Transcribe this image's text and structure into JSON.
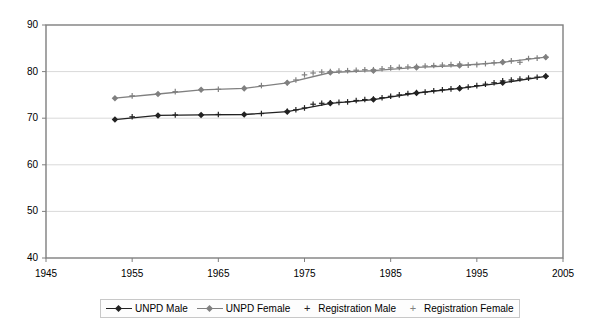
{
  "chart_data": {
    "type": "line",
    "title": "",
    "xlabel": "",
    "ylabel": "",
    "xlim": [
      1945,
      2005
    ],
    "ylim": [
      40,
      90
    ],
    "xticks": [
      1945,
      1955,
      1965,
      1975,
      1985,
      1995,
      2005
    ],
    "yticks": [
      40,
      50,
      60,
      70,
      80,
      90
    ],
    "grid": "horizontal",
    "legend_position": "bottom",
    "colors": {
      "unpd_male": "#222222",
      "unpd_female": "#808080",
      "registration_male": "#222222",
      "registration_female": "#808080",
      "gridline": "#d9d9d9",
      "axis": "#7f7f7f",
      "background": "#ffffff"
    },
    "series": [
      {
        "name": "UNPD Male",
        "marker": "diamond",
        "style": "line",
        "x": [
          1953,
          1958,
          1963,
          1968,
          1973,
          1978,
          1983,
          1988,
          1993,
          1998,
          2003
        ],
        "values": [
          69.7,
          70.6,
          70.7,
          70.8,
          71.4,
          73.2,
          74.0,
          75.4,
          76.4,
          77.6,
          79.0
        ]
      },
      {
        "name": "UNPD Female",
        "marker": "diamond",
        "style": "line",
        "x": [
          1953,
          1958,
          1963,
          1968,
          1973,
          1978,
          1983,
          1988,
          1993,
          1998,
          2003
        ],
        "values": [
          74.3,
          75.2,
          76.1,
          76.4,
          77.6,
          79.8,
          80.2,
          80.9,
          81.3,
          82.0,
          83.1
        ]
      },
      {
        "name": "Registration Male",
        "marker": "plus",
        "style": "markers",
        "x": [
          1955,
          1960,
          1965,
          1970,
          1973,
          1974,
          1975,
          1976,
          1977,
          1978,
          1979,
          1980,
          1981,
          1982,
          1983,
          1984,
          1985,
          1986,
          1987,
          1988,
          1989,
          1990,
          1991,
          1992,
          1993,
          1994,
          1995,
          1996,
          1997,
          1998,
          1999,
          2000,
          2001,
          2002,
          2003
        ],
        "values": [
          70.3,
          70.7,
          70.8,
          71.0,
          71.5,
          71.8,
          72.2,
          73.0,
          73.2,
          73.3,
          73.4,
          73.5,
          73.8,
          74.0,
          74.1,
          74.4,
          74.7,
          75.0,
          75.3,
          75.5,
          75.6,
          75.9,
          76.1,
          76.3,
          76.5,
          76.7,
          77.0,
          77.3,
          77.6,
          78.0,
          78.2,
          78.4,
          78.6,
          78.8,
          79.0
        ]
      },
      {
        "name": "Registration Female",
        "marker": "plus",
        "style": "markers",
        "x": [
          1955,
          1960,
          1965,
          1970,
          1973,
          1974,
          1975,
          1976,
          1977,
          1978,
          1979,
          1980,
          1981,
          1982,
          1983,
          1984,
          1985,
          1986,
          1987,
          1988,
          1989,
          1990,
          1991,
          1992,
          1993,
          1994,
          1995,
          1996,
          1997,
          1998,
          1999,
          2000,
          2001,
          2002,
          2003
        ],
        "values": [
          74.8,
          75.7,
          76.2,
          77.0,
          77.6,
          78.2,
          79.3,
          79.7,
          79.9,
          80.0,
          80.1,
          80.2,
          80.3,
          80.4,
          80.4,
          80.6,
          80.8,
          80.9,
          81.0,
          81.1,
          81.2,
          81.3,
          81.4,
          81.5,
          81.6,
          81.4,
          81.5,
          81.7,
          81.9,
          82.1,
          82.3,
          82.0,
          82.8,
          82.9,
          83.1
        ]
      }
    ]
  },
  "legend": {
    "items": [
      {
        "label": "UNPD Male",
        "marker": "line-diamond",
        "color": "#222222"
      },
      {
        "label": "UNPD Female",
        "marker": "line-diamond",
        "color": "#808080"
      },
      {
        "label": "Registration Male",
        "marker": "plus",
        "color": "#222222"
      },
      {
        "label": "Registration Female",
        "marker": "plus",
        "color": "#808080"
      }
    ]
  }
}
